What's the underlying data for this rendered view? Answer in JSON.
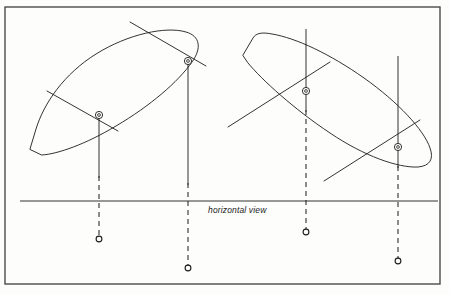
{
  "figure": {
    "kind": "technical-line-drawing",
    "caption": "horizontal view",
    "background_color": "#fdfdfc",
    "ink_color": "#1c1c1c",
    "frame_color": "#4a4a4a"
  },
  "frame": {
    "x": 5,
    "y": 7,
    "width": 435,
    "height": 277
  },
  "baseline": {
    "label": "horizontal view",
    "y": 201,
    "x_start": 20,
    "x_end": 438,
    "caption_x": 208,
    "caption_y": 209
  },
  "hulls": [
    {
      "name": "left-hull",
      "path": "M 30 149 L 36 129 C 44 103 64 74 96 54 C 128 34 166 26 186 32 C 200 36 202 48 192 62 C 178 82 150 106 116 126 C 86 144 58 154 42 155 Z",
      "bow_side": "upper-right",
      "transom_side": "lower-left"
    },
    {
      "name": "right-hull",
      "path": "M 243 55 L 253 38 C 256 33 262 32 272 34 C 296 38 330 54 364 78 C 398 102 424 130 430 148 C 434 159 430 166 418 167 C 398 168 364 156 330 133 C 294 109 262 80 248 63 Z",
      "bow_side": "lower-right",
      "transom_side": "upper-left"
    }
  ],
  "masts": [
    {
      "id": "mast-1",
      "hull": "left-hull",
      "x": 99,
      "y": 115,
      "vertical_top": 115,
      "vertical_solid_bottom": 178,
      "dashed_bottom": 237,
      "projection_y": 239,
      "spar": {
        "x1": 47,
        "y1": 91,
        "x2": 118,
        "y2": 131
      }
    },
    {
      "id": "mast-2",
      "hull": "left-hull",
      "x": 188,
      "y": 61,
      "vertical_top": 61,
      "vertical_solid_bottom": 185,
      "dashed_bottom": 266,
      "projection_y": 268,
      "spar": {
        "x1": 130,
        "y1": 22,
        "x2": 206,
        "y2": 66
      }
    },
    {
      "id": "mast-3",
      "hull": "right-hull",
      "x": 306,
      "y": 91,
      "vertical_top": 29,
      "vertical_solid_bottom": 112,
      "dashed_bottom": 230,
      "projection_y": 232,
      "spar": {
        "x1": 228,
        "y1": 127,
        "x2": 330,
        "y2": 62
      }
    },
    {
      "id": "mast-4",
      "hull": "right-hull",
      "x": 398,
      "y": 147,
      "vertical_top": 56,
      "vertical_solid_bottom": 168,
      "dashed_bottom": 259,
      "projection_y": 261,
      "spar": {
        "x1": 324,
        "y1": 181,
        "x2": 420,
        "y2": 120
      }
    }
  ],
  "markers": {
    "mast_marker": {
      "name": "concentric-circle-marker",
      "outer_radius": 3.6,
      "inner_radius": 1.4
    },
    "projection_marker": {
      "name": "open-circle-marker",
      "radius": 2.9
    }
  }
}
